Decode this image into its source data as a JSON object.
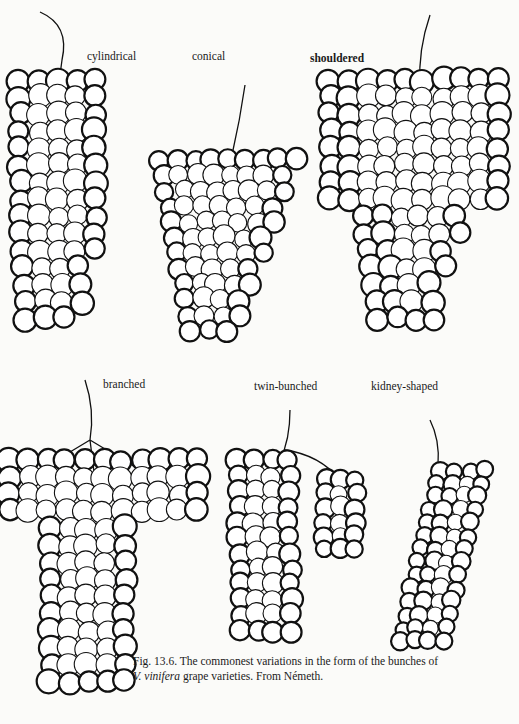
{
  "figure": {
    "labels": {
      "cylindrical": "cylindrical",
      "conical": "conical",
      "shouldered": "shouldered",
      "branched": "branched",
      "twin_bunched": "twin-bunched",
      "kidney_shaped": "kidney-shaped"
    },
    "caption": {
      "line1": "Fig. 13.6. The commonest variations in the form of the bunches of",
      "line2_italic": "V. vinifera",
      "line2_rest": " grape varieties. From Németh."
    }
  }
}
